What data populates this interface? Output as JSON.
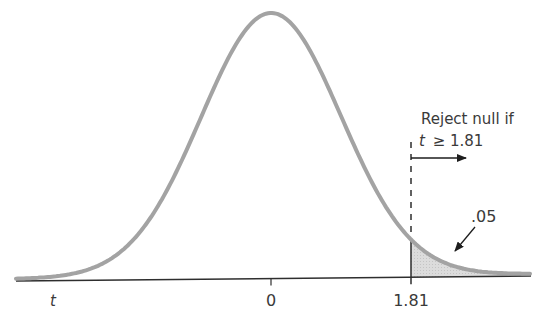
{
  "diagram": {
    "type": "t-distribution one-tailed rejection region",
    "curve": {
      "center_x": 271,
      "peak_y": 15,
      "sigma_px": 70,
      "x_start": 16,
      "x_end": 531,
      "stroke_color": "#a3a3a3",
      "stroke_width": 4
    },
    "axis": {
      "x1": 16,
      "y1": 281,
      "x2": 531,
      "y2": 276,
      "color": "#2e2e2e",
      "variable_label": "t",
      "ticks": [
        {
          "label": "0",
          "x": 271
        },
        {
          "label": "1.81",
          "x": 411
        }
      ]
    },
    "critical_value": {
      "value": "1.81",
      "x": 411,
      "dashed_line_top_y": 142
    },
    "rejection_region": {
      "fill_color": "#dadada",
      "area_label": ".05"
    },
    "annotation": {
      "line1": "Reject null if",
      "line2_var": "t",
      "line2_rest": "≥ 1.81"
    },
    "colors": {
      "background": "#ffffff",
      "text": "#3a3a3a",
      "arrow": "#1e1e1e"
    }
  }
}
